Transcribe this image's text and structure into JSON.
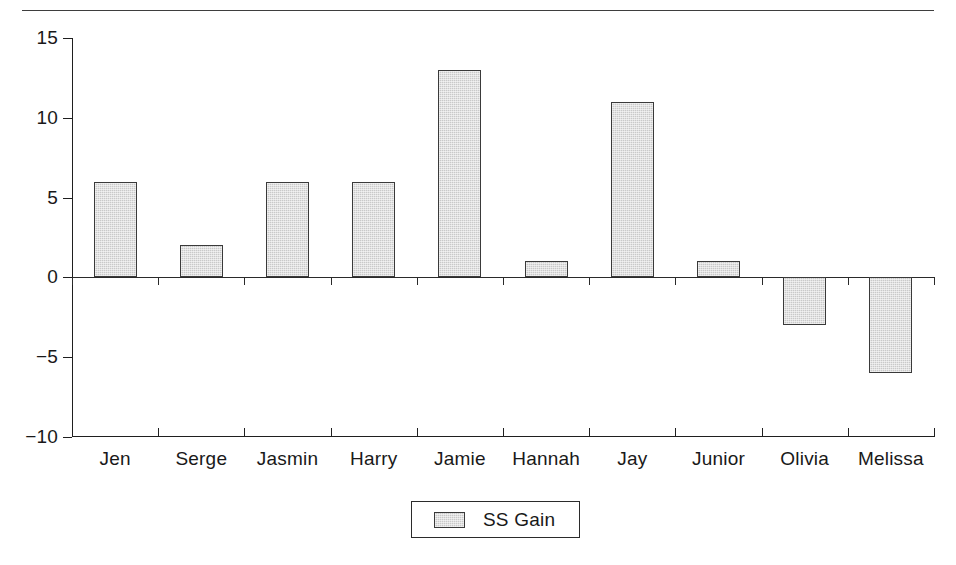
{
  "chart_data": {
    "type": "bar",
    "title": "",
    "subtitle": "",
    "xlabel": "",
    "ylabel": "",
    "categories": [
      "Jen",
      "Serge",
      "Jasmin",
      "Harry",
      "Jamie",
      "Hannah",
      "Jay",
      "Junior",
      "Olivia",
      "Melissa"
    ],
    "series": [
      {
        "name": "SS Gain",
        "values": [
          6,
          2,
          6,
          6,
          13,
          1,
          11,
          1,
          -3,
          -6
        ]
      }
    ],
    "values": [
      6,
      2,
      6,
      6,
      13,
      1,
      11,
      1,
      -3,
      -6
    ],
    "ylim": [
      -10,
      15
    ],
    "yticks": [
      15,
      10,
      5,
      0,
      -5,
      -10
    ],
    "ytick_labels": [
      "15",
      "10",
      "5",
      "0",
      "−5",
      "−10"
    ],
    "grid": false,
    "legend": {
      "position": "bottom-center",
      "entries": [
        {
          "label": "SS Gain",
          "swatch": "bar-swatch",
          "color": "#c9c9c9"
        }
      ]
    },
    "colors": {
      "bar_fill": "#c9c9c9",
      "bar_stroke": "#3a3a3a",
      "axis": "#1f1f1f",
      "text": "#191919",
      "background": "#ffffff"
    },
    "annotations": []
  },
  "figure": {
    "top_rule": "horizontal-rule"
  }
}
